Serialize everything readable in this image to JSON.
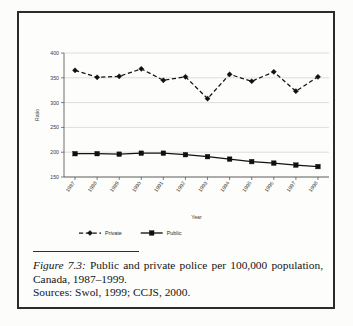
{
  "figure": {
    "label": "Figure 7.3:",
    "caption": "Public and private police per 100,000 population, Canada, 1987–1999.",
    "sources": "Sources: Swol, 1999; CCJS, 2000."
  },
  "chart_data": {
    "type": "line",
    "title": "",
    "xlabel": "Year",
    "ylabel": "Ratio",
    "categories": [
      "1987",
      "1988",
      "1989",
      "1990",
      "1991",
      "1992",
      "1993",
      "1994",
      "1995",
      "1996",
      "1997",
      "1998"
    ],
    "series": [
      {
        "name": "Private",
        "style": "dashed",
        "marker": "diamond",
        "color": "#101010",
        "values": [
          365,
          351,
          353,
          368,
          345,
          352,
          308,
          357,
          343,
          362,
          323,
          352
        ]
      },
      {
        "name": "Public",
        "style": "solid",
        "marker": "square",
        "color": "#101010",
        "values": [
          197,
          197,
          196,
          198,
          198,
          195,
          191,
          186,
          181,
          178,
          174,
          171
        ]
      }
    ],
    "ylim": [
      150,
      400
    ],
    "yticks": [
      150,
      200,
      250,
      300,
      350,
      400
    ],
    "grid": true,
    "legend_position": "bottom"
  }
}
